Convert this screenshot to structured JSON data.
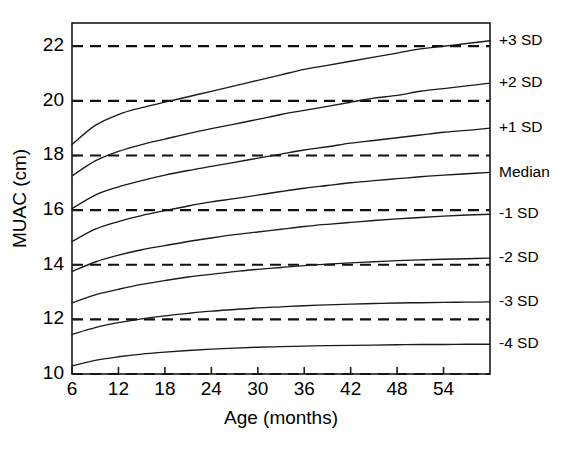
{
  "figure": {
    "name": "muac-for-age-reference-chart",
    "background_color": "#ffffff",
    "line_color": "#1a1a1a",
    "ref_line_color": "#111111"
  },
  "chart_data": {
    "type": "line",
    "title": "",
    "subtitle": "",
    "xlabel": "Age (months)",
    "ylabel": "MUAC (cm)",
    "xlim": [
      6,
      60
    ],
    "ylim": [
      10,
      22.85
    ],
    "xticks": [
      6,
      12,
      18,
      24,
      30,
      36,
      42,
      48,
      54
    ],
    "xtick_labels": [
      "6",
      "12",
      "18",
      "24",
      "30",
      "36",
      "42",
      "48",
      "54"
    ],
    "yticks": [
      10,
      12,
      14,
      16,
      18,
      20,
      22
    ],
    "ytick_labels": [
      "10",
      "12",
      "14",
      "16",
      "18",
      "20",
      "22"
    ],
    "grid": false,
    "reference_lines": {
      "orientation": "horizontal",
      "style": "dashed",
      "values": [
        10,
        12,
        14,
        16,
        18,
        20,
        22
      ]
    },
    "legend_position": "right-outside",
    "x": [
      6,
      9,
      12,
      15,
      18,
      21,
      24,
      27,
      30,
      33,
      36,
      39,
      42,
      45,
      48,
      51,
      54,
      57,
      60
    ],
    "series": [
      {
        "name": "+3 SD",
        "label": "+3 SD",
        "values": [
          18.4,
          19.1,
          19.5,
          19.75,
          19.95,
          20.15,
          20.35,
          20.55,
          20.75,
          20.95,
          21.15,
          21.3,
          21.45,
          21.6,
          21.75,
          21.9,
          22.0,
          22.1,
          22.2
        ]
      },
      {
        "name": "+2 SD",
        "label": "+2 SD",
        "values": [
          17.25,
          17.8,
          18.15,
          18.4,
          18.6,
          18.8,
          18.98,
          19.15,
          19.32,
          19.5,
          19.65,
          19.8,
          19.95,
          20.1,
          20.2,
          20.35,
          20.45,
          20.55,
          20.65
        ]
      },
      {
        "name": "+1 SD",
        "label": "+1 SD",
        "values": [
          16.05,
          16.55,
          16.85,
          17.08,
          17.28,
          17.45,
          17.6,
          17.75,
          17.9,
          18.05,
          18.2,
          18.32,
          18.45,
          18.55,
          18.65,
          18.75,
          18.85,
          18.92,
          19.0
        ]
      },
      {
        "name": "Median",
        "label": "Median",
        "values": [
          14.85,
          15.3,
          15.58,
          15.8,
          15.98,
          16.15,
          16.3,
          16.42,
          16.55,
          16.68,
          16.8,
          16.9,
          17.0,
          17.08,
          17.15,
          17.22,
          17.28,
          17.33,
          17.38
        ]
      },
      {
        "name": "-1 SD",
        "label": "-1 SD",
        "values": [
          13.75,
          14.1,
          14.35,
          14.55,
          14.7,
          14.85,
          14.98,
          15.1,
          15.2,
          15.3,
          15.4,
          15.48,
          15.55,
          15.62,
          15.68,
          15.73,
          15.78,
          15.82,
          15.85
        ]
      },
      {
        "name": "-2 SD",
        "label": "-2 SD",
        "values": [
          12.6,
          12.9,
          13.1,
          13.28,
          13.42,
          13.55,
          13.65,
          13.75,
          13.83,
          13.9,
          13.97,
          14.02,
          14.07,
          14.11,
          14.15,
          14.18,
          14.2,
          14.22,
          14.24
        ]
      },
      {
        "name": "-3 SD",
        "label": "-3 SD",
        "values": [
          11.45,
          11.7,
          11.88,
          12.02,
          12.13,
          12.22,
          12.3,
          12.36,
          12.42,
          12.46,
          12.5,
          12.53,
          12.56,
          12.58,
          12.6,
          12.61,
          12.62,
          12.63,
          12.64
        ]
      },
      {
        "name": "-4 SD",
        "label": "-4 SD",
        "values": [
          10.3,
          10.5,
          10.63,
          10.73,
          10.8,
          10.86,
          10.91,
          10.95,
          10.98,
          11.0,
          11.02,
          11.04,
          11.05,
          11.06,
          11.07,
          11.08,
          11.08,
          11.09,
          11.09
        ]
      }
    ]
  }
}
